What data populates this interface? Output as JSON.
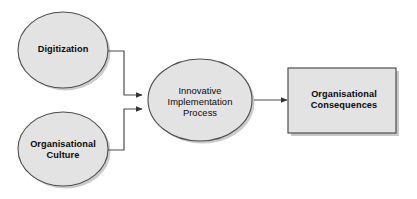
{
  "diagram": {
    "type": "flow-diagram",
    "title": "",
    "background_color": "#ffffff",
    "node_fill_color": "#e3e3e3",
    "node_stroke_color": "#4d4d4d",
    "shadow_color": "#9a9a9a",
    "text_color": "#0a0a0a",
    "connector_color": "#4d4d4d",
    "nodes": [
      {
        "id": "digitization",
        "label": "Digitization",
        "shape": "ellipse",
        "emphasis": "bold"
      },
      {
        "id": "organisational-culture",
        "label": "Organisational\nCulture",
        "shape": "ellipse",
        "emphasis": "bold"
      },
      {
        "id": "innovative-implementation-process",
        "label": "Innovative\nImplementation\nProcess",
        "shape": "ellipse",
        "emphasis": "regular"
      },
      {
        "id": "organisational-consequences",
        "label": "Organisational\nConsequences",
        "shape": "rectangle",
        "emphasis": "bold"
      }
    ],
    "edges": [
      {
        "id": "edge-digitization-to-process",
        "from": "digitization",
        "to": "innovative-implementation-process",
        "style": "elbow",
        "arrow": "end"
      },
      {
        "id": "edge-culture-to-process",
        "from": "organisational-culture",
        "to": "innovative-implementation-process",
        "style": "elbow",
        "arrow": "end"
      },
      {
        "id": "edge-process-to-consequences",
        "from": "innovative-implementation-process",
        "to": "organisational-consequences",
        "style": "straight",
        "arrow": "end"
      }
    ]
  }
}
